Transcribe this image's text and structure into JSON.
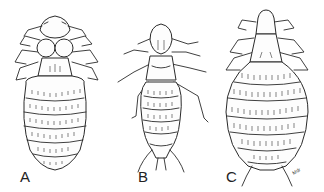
{
  "figure": {
    "panels": [
      {
        "id": "A",
        "label": "A"
      },
      {
        "id": "B",
        "label": "B"
      },
      {
        "id": "C",
        "label": "C"
      }
    ],
    "artist_signature": "Mdr",
    "colors": {
      "background": "#ffffff",
      "ink": "#2a2a2a"
    }
  }
}
